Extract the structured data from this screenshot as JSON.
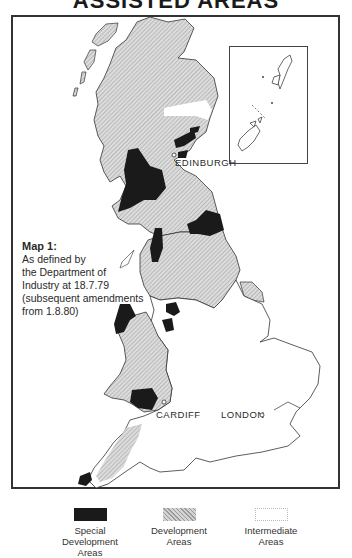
{
  "title": "ASSISTED AREAS",
  "map": {
    "caption": {
      "heading": "Map 1:",
      "lines": [
        "As defined by",
        "the Department of",
        "Industry at 18.7.79",
        "(subsequent amendments",
        "from 1.8.80)"
      ]
    },
    "cities": [
      {
        "name": "EDINBURGH",
        "x": 175,
        "y": 163
      },
      {
        "name": "CARDIFF",
        "x": 156,
        "y": 414
      },
      {
        "name": "LONDON",
        "x": 221,
        "y": 414
      }
    ],
    "inset": {
      "content": "Orkney and Shetland Islands"
    }
  },
  "legend": {
    "items": [
      {
        "label": "Special Development Areas",
        "lines": [
          "Special",
          "Development",
          "Areas"
        ],
        "color": "#1a1a1a"
      },
      {
        "label": "Development Areas",
        "lines": [
          "Development",
          "Areas"
        ],
        "color": "#d4d4d4"
      },
      {
        "label": "Intermediate Areas",
        "lines": [
          "Intermediate",
          "Areas"
        ],
        "color": "#ffffff"
      }
    ]
  },
  "colors": {
    "special": "#1a1a1a",
    "development": "#d4d4d4",
    "coast": "#333333"
  }
}
